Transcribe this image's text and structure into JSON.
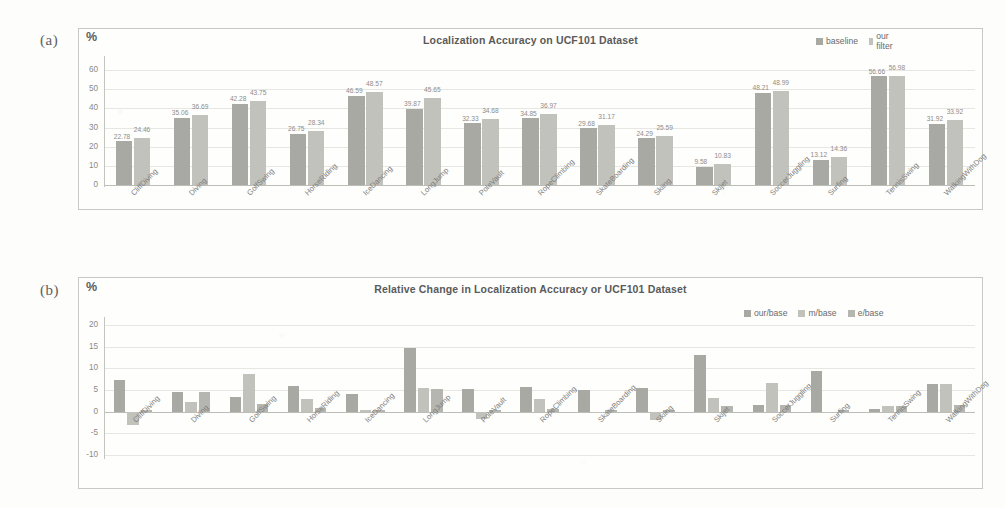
{
  "figure": {
    "panel_a_tag": "(a)",
    "panel_b_tag": "(b)"
  },
  "chart_data": [
    {
      "id": "panel-a",
      "type": "bar",
      "title": "Localization Accuracy on UCF101 Dataset",
      "ylabel": "%",
      "xlabel": "",
      "ylim": [
        0,
        60
      ],
      "yticks": [
        0,
        10,
        20,
        30,
        40,
        50,
        60
      ],
      "grid": true,
      "legend_position": "top-right",
      "categories": [
        "CliffDiving",
        "Diving",
        "GolfSwing",
        "HorseRiding",
        "IceDancing",
        "LongJump",
        "PoleVault",
        "RopeClimbing",
        "SkateBoarding",
        "Skiing",
        "Skijet",
        "SoccerJuggling",
        "Surfing",
        "TennisSwing",
        "WalkingWithDog"
      ],
      "series": [
        {
          "name": "baseline",
          "color": "#a9a9a4",
          "values": [
            22.78,
            35.06,
            42.28,
            26.75,
            46.59,
            39.87,
            32.33,
            34.85,
            29.68,
            24.29,
            9.58,
            48.21,
            13.12,
            56.66,
            31.92
          ]
        },
        {
          "name": "our filter",
          "color": "#c2c2bd",
          "values": [
            24.46,
            36.69,
            43.75,
            28.34,
            48.57,
            45.65,
            34.68,
            36.97,
            31.17,
            25.59,
            10.83,
            48.99,
            14.36,
            56.98,
            33.92
          ]
        }
      ],
      "data_labels": [
        [
          "22.78",
          "24.46"
        ],
        [
          "35.06",
          "36.69"
        ],
        [
          "42.28",
          "43.75"
        ],
        [
          "26.75",
          "28.34"
        ],
        [
          "46.59",
          "48.57"
        ],
        [
          "39.87",
          "45.65"
        ],
        [
          "32.33",
          "34.68"
        ],
        [
          "34.85",
          "36.97"
        ],
        [
          "29.68",
          "31.17"
        ],
        [
          "24.29",
          "25.59"
        ],
        [
          "9.58",
          "10.83"
        ],
        [
          "48.21",
          "48.99"
        ],
        [
          "13.12",
          "14.36"
        ],
        [
          "56.66",
          "56.98"
        ],
        [
          "31.92",
          "33.92"
        ]
      ]
    },
    {
      "id": "panel-b",
      "type": "bar",
      "title": "Relative Change in Localization Accuracy or  UCF101 Dataset",
      "ylabel": "%",
      "xlabel": "",
      "ylim": [
        -10,
        20
      ],
      "yticks": [
        -10,
        -5,
        0,
        5,
        10,
        15,
        20
      ],
      "grid": true,
      "legend_position": "top-right",
      "categories": [
        "CliffDiving",
        "Diving",
        "GolfSwing",
        "HorseRiding",
        "IceDancing",
        "LongJump",
        "PoleVault",
        "RopeClimbing",
        "SkateBoarding",
        "Skiing",
        "Skijet",
        "SoccerJuggling",
        "Surfing",
        "TennisSwing",
        "WalkingWithDog"
      ],
      "series": [
        {
          "name": "our/base",
          "color": "#a9a9a4",
          "values": [
            7.4,
            4.6,
            3.5,
            5.9,
            4.0,
            14.6,
            5.3,
            5.6,
            4.9,
            5.5,
            13.1,
            1.6,
            9.5,
            0.6,
            6.3
          ]
        },
        {
          "name": "m/base",
          "color": "#c2c2bd",
          "values": [
            -3.1,
            2.2,
            8.8,
            3.0,
            0.4,
            5.4,
            -1.8,
            2.9,
            -0.2,
            -1.9,
            3.1,
            6.7,
            -0.4,
            1.3,
            6.3
          ]
        },
        {
          "name": "e/base",
          "color": "#b6b6b1",
          "values": [
            0.5,
            4.5,
            1.8,
            0.8,
            0.5,
            5.3,
            0.3,
            0.6,
            0.3,
            0.3,
            1.4,
            1.5,
            0.4,
            1.2,
            1.5
          ]
        }
      ]
    }
  ]
}
